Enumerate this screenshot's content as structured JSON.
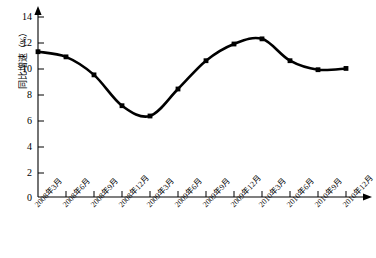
{
  "chart_data": {
    "type": "line",
    "title": "",
    "xlabel": "",
    "ylabel": "同比增速（%）",
    "ylim": [
      0,
      14
    ],
    "yticks": [
      0,
      2,
      4,
      6,
      8,
      10,
      12,
      14
    ],
    "ytick_labels": [
      "0",
      "2",
      "4",
      "6",
      "8",
      "10",
      "12",
      "14"
    ],
    "grid": false,
    "legend": false,
    "marker": "square",
    "line_color": "#000000",
    "categories": [
      "2008年3月",
      "2008年6月",
      "2008年9月",
      "2008年12月",
      "2009年3月",
      "2009年6月",
      "2009年9月",
      "2009年12月",
      "2010年3月",
      "2010年6月",
      "2010年9月",
      "2010年12月"
    ],
    "values": [
      11.3,
      10.9,
      9.5,
      7.1,
      6.3,
      8.4,
      10.6,
      11.9,
      12.3,
      10.6,
      9.9,
      10.0
    ],
    "annotations": []
  },
  "axis": {
    "y_arrow": "up-arrow",
    "x_arrow": "right-arrow"
  }
}
